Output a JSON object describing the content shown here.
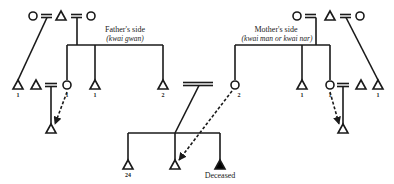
{
  "diagram": {
    "type": "kinship-chart",
    "colors": {
      "line": "#1a1a1a",
      "deceased_fill": "#000000",
      "background": "#ffffff"
    },
    "legend": {
      "triangle": "male",
      "circle": "female",
      "double_line": "marriage",
      "dashed_arrow": "incoming share/obligation",
      "filled_triangle": "deceased"
    },
    "fathers_side": {
      "title": "Father's side",
      "subtitle": "(kwai gwan)",
      "top_row": [
        "circle",
        "=",
        "triangle",
        "=",
        "circle"
      ],
      "children": [
        {
          "symbol": "triangle",
          "count": "1"
        },
        {
          "symbol": "circle",
          "count": "1",
          "married_to": "triangle",
          "child": "triangle"
        },
        {
          "symbol": "triangle",
          "count": "1"
        },
        {
          "symbol": "triangle",
          "count": "2"
        }
      ]
    },
    "mothers_side": {
      "title": "Mother's side",
      "subtitle": "(kwai man or kwai nar)",
      "top_row": [
        "circle",
        "=",
        "triangle",
        "=",
        "circle"
      ],
      "children": [
        {
          "symbol": "circle",
          "count": "2"
        },
        {
          "symbol": "triangle",
          "count": "1"
        },
        {
          "symbol": "circle",
          "count": "1",
          "married_to": "triangle",
          "child": "triangle"
        },
        {
          "symbol": "triangle",
          "count": "1"
        }
      ]
    },
    "center_family": {
      "children": [
        {
          "symbol": "triangle",
          "count": "24"
        },
        {
          "symbol": "triangle",
          "count": ""
        },
        {
          "symbol": "filled-triangle",
          "label": "Deceased"
        }
      ]
    },
    "labels": {
      "father_title": "Father's side",
      "father_sub": "(kwai gwan)",
      "mother_title": "Mother's side",
      "mother_sub": "(kwai man or kwai nar)",
      "n_left_1": "1",
      "n_left_circle": "1",
      "n_left_3": "1",
      "n_left_4": "2",
      "n_right_circle2": "2",
      "n_right_tri": "1",
      "n_right_circle1": "1",
      "n_right_far": "1",
      "n_center_24": "24",
      "deceased": "Deceased"
    }
  }
}
